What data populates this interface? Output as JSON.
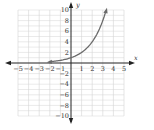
{
  "chart_data": {
    "type": "line",
    "title": "",
    "xlabel": "x",
    "ylabel": "y",
    "xlim": [
      -5,
      5
    ],
    "ylim": [
      -10,
      10
    ],
    "grid": true,
    "x_ticks": [
      "-5",
      "-4",
      "-3",
      "-2",
      "-1",
      "1",
      "2",
      "3",
      "4",
      "5"
    ],
    "y_ticks": [
      "10",
      "8",
      "6",
      "4",
      "2",
      "-2",
      "-4",
      "-6",
      "-8",
      "-10"
    ],
    "series": [
      {
        "name": "y = 2^x",
        "x": [
          -2,
          -1.5,
          -1,
          -0.5,
          0,
          0.5,
          1,
          1.5,
          2,
          2.5,
          3,
          3.3
        ],
        "values": [
          0.25,
          0.35,
          0.5,
          0.71,
          1,
          1.41,
          2,
          2.83,
          4,
          5.66,
          8,
          9.85
        ],
        "color": "#666666",
        "arrows": "both"
      }
    ],
    "colors": {
      "grid": "#d4d4d4",
      "axis": "#222222",
      "curve": "#6a6a6a"
    }
  }
}
